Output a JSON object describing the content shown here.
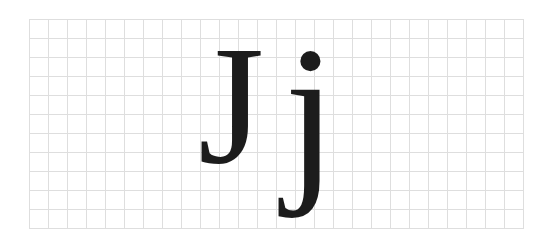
{
  "figure": {
    "grid": {
      "columns": 26,
      "rows": 11,
      "cell_size_px": 19,
      "line_color": "#dedede"
    },
    "letters": [
      {
        "char": "J",
        "case": "uppercase"
      },
      {
        "char": "j",
        "case": "lowercase"
      }
    ],
    "glyph_color": "#1c1c1c"
  }
}
